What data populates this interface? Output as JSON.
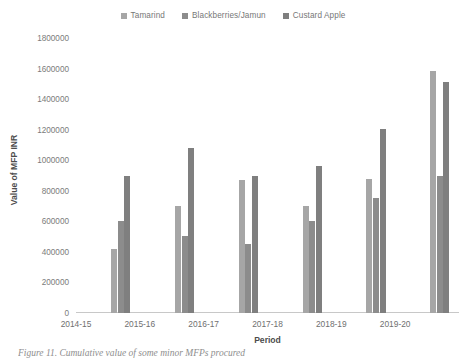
{
  "legend": {
    "position": "top-center",
    "items": [
      {
        "label": "Tamarind",
        "color": "#a6a6a6"
      },
      {
        "label": "Blackberries/Jamun",
        "color": "#8c8c8c"
      },
      {
        "label": "Custard Apple",
        "color": "#7f7f7f"
      }
    ]
  },
  "axes": {
    "x_title": "Period",
    "y_title": "Value of MFP INR",
    "y_ticks": [
      "0",
      "200000",
      "400000",
      "600000",
      "800000",
      "1000000",
      "1200000",
      "1400000",
      "1600000",
      "1800000"
    ],
    "x_ticks": [
      "2014-15",
      "2015-16",
      "2016-17",
      "2017-18",
      "2018-19",
      "2019-20"
    ]
  },
  "caption": {
    "text": "Figure 11. Cumulative value of some minor MFPs procured"
  },
  "chart_data": {
    "type": "bar",
    "title": "",
    "subtitle": "",
    "xlabel": "Period",
    "ylabel": "Value of MFP INR",
    "ylim": [
      0,
      1800000
    ],
    "ytick_step": 200000,
    "grid": false,
    "legend_position": "top-center",
    "categories": [
      "2014-15",
      "2015-16",
      "2016-17",
      "2017-18",
      "2018-19",
      "2019-20"
    ],
    "series": [
      {
        "name": "Tamarind",
        "color": "#a6a6a6",
        "values": [
          420000,
          700000,
          870000,
          700000,
          875000,
          1585000
        ]
      },
      {
        "name": "Blackberries/Jamun",
        "color": "#8c8c8c",
        "values": [
          600000,
          505000,
          450000,
          600000,
          755000,
          900000
        ]
      },
      {
        "name": "Custard Apple",
        "color": "#7f7f7f",
        "values": [
          900000,
          1080000,
          900000,
          960000,
          1205000,
          1510000
        ]
      }
    ]
  }
}
